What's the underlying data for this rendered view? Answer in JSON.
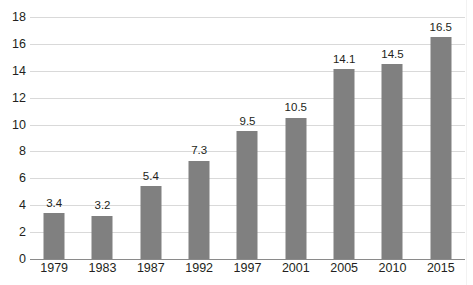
{
  "chart_data": {
    "type": "bar",
    "title": "",
    "xlabel": "",
    "ylabel": "",
    "categories": [
      "1979",
      "1983",
      "1987",
      "1992",
      "1997",
      "2001",
      "2005",
      "2010",
      "2015"
    ],
    "values": [
      3.4,
      3.2,
      5.4,
      7.3,
      9.5,
      10.5,
      14.1,
      14.5,
      16.5
    ],
    "value_labels": [
      "3.4",
      "3.2",
      "5.4",
      "7.3",
      "9.5",
      "10.5",
      "14.1",
      "14.5",
      "16.5"
    ],
    "ylim": [
      0,
      18
    ],
    "ytick_step": 2,
    "ytick_labels": [
      "0",
      "2",
      "4",
      "6",
      "8",
      "10",
      "12",
      "14",
      "16",
      "18"
    ],
    "grid": true,
    "legend": "none",
    "bar_color": "#808080",
    "gridline_color": "#d9d9d9",
    "axis_color": "#8a8a8a",
    "text_color": "#231f20",
    "background_color": "#ffffff"
  }
}
